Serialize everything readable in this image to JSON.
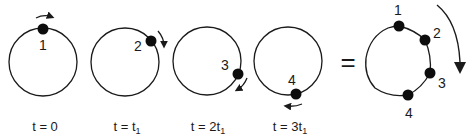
{
  "diagram": {
    "panels": [
      {
        "point_label": "1",
        "time_label_prefix": "t = ",
        "time_label_value": "0",
        "time_label_sub": ""
      },
      {
        "point_label": "2",
        "time_label_prefix": "t = ",
        "time_label_value": "t",
        "time_label_sub": "1"
      },
      {
        "point_label": "3",
        "time_label_prefix": "t = ",
        "time_label_value": "2t",
        "time_label_sub": "1"
      },
      {
        "point_label": "4",
        "time_label_prefix": "t = ",
        "time_label_value": "3t",
        "time_label_sub": "1"
      }
    ],
    "equals_sign": "=",
    "composite": {
      "point_labels": [
        "1",
        "2",
        "3",
        "4"
      ]
    },
    "colors": {
      "stroke": "#1a1a1a",
      "dot": "#0d0d0d",
      "background": "#ffffff"
    }
  }
}
